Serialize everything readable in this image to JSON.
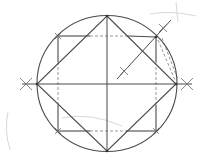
{
  "diagram": {
    "title": "",
    "colors": {
      "background": "#ffffff",
      "stroke": "#4a4a4a",
      "dashed": "#8a8a8a",
      "sketch": "#d8d8d8"
    },
    "circle": {
      "cx": 107,
      "cy": 83.5,
      "rx": 70,
      "ry": 68
    },
    "diameters": {
      "horizontal": {
        "x1": 22,
        "y1": 84,
        "x2": 192,
        "y2": 84
      },
      "vertical": {
        "x1": 107,
        "y1": 16,
        "x2": 107,
        "y2": 151
      }
    },
    "diamond": [
      [
        107,
        16
      ],
      [
        176,
        84
      ],
      [
        107,
        151
      ],
      [
        37,
        84
      ]
    ],
    "square_solid_edges": [
      [
        [
          58,
          36
        ],
        [
          90,
          36
        ]
      ],
      [
        [
          58,
          36
        ],
        [
          58,
          62
        ]
      ],
      [
        [
          156,
          37
        ],
        [
          156,
          62
        ]
      ],
      [
        [
          58,
          105
        ],
        [
          58,
          131
        ]
      ],
      [
        [
          58,
          131
        ],
        [
          90,
          131
        ]
      ],
      [
        [
          126,
          131
        ],
        [
          156,
          131
        ]
      ],
      [
        [
          156,
          105
        ],
        [
          156,
          131
        ]
      ],
      [
        [
          128,
          36
        ],
        [
          156,
          37
        ]
      ]
    ],
    "square_dashed_edges": [
      [
        [
          90,
          36
        ],
        [
          128,
          36
        ]
      ],
      [
        [
          58,
          62
        ],
        [
          58,
          105
        ]
      ],
      [
        [
          156,
          62
        ],
        [
          156,
          105
        ]
      ],
      [
        [
          90,
          131
        ],
        [
          126,
          131
        ]
      ],
      [
        [
          158,
          40
        ],
        [
          175,
          80
        ]
      ],
      [
        [
          162,
          38
        ],
        [
          178,
          80
        ]
      ]
    ],
    "bisector": {
      "x1": 117,
      "y1": 79,
      "x2": 171,
      "y2": 20
    },
    "cross_marks": [
      {
        "cx": 26,
        "cy": 84,
        "size": 6
      },
      {
        "cx": 187,
        "cy": 84,
        "size": 6
      },
      {
        "cx": 124,
        "cy": 71,
        "size": 4
      },
      {
        "cx": 163,
        "cy": 28,
        "size": 4
      },
      {
        "cx": 58,
        "cy": 36,
        "size": 3
      },
      {
        "cx": 156,
        "cy": 131,
        "size": 3
      },
      {
        "cx": 58,
        "cy": 131,
        "size": 3
      }
    ],
    "vertices": [
      [
        107,
        16
      ],
      [
        176,
        84
      ],
      [
        107,
        151
      ],
      [
        37,
        84
      ],
      [
        156,
        37
      ]
    ]
  }
}
